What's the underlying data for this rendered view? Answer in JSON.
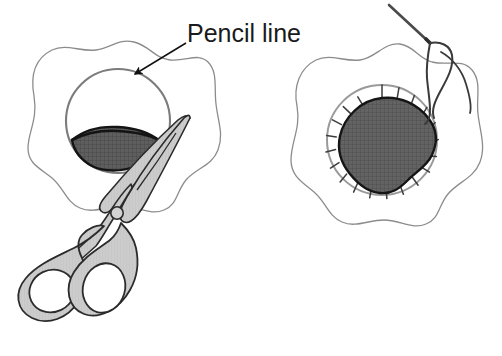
{
  "figure": {
    "background_color": "#ffffff"
  },
  "annotations": {
    "pencil_line_label": "Pencil line"
  },
  "panels": [
    {
      "id": "left-panel",
      "name": "cutting-step",
      "elements": [
        "fabric-outline",
        "pencil-circle",
        "cut-slit",
        "scissors",
        "pencil-line-callout"
      ]
    },
    {
      "id": "right-panel",
      "name": "stitching-step",
      "elements": [
        "fabric-outline",
        "pencil-circle",
        "notch-marks",
        "patch",
        "needle",
        "thread"
      ]
    }
  ],
  "colors": {
    "outline": "#6e6e6e",
    "ink": "#1a1a1a",
    "pencil_circle": "#7a7a7a",
    "scissors_fill": "#c9c9c9",
    "scissors_stroke": "#2b2b2b",
    "patch_fill": "#636363",
    "patch_stroke": "#1a1a1a",
    "notch_stroke": "#3d3d3d",
    "needle": "#4a4a4a",
    "thread": "#3a3a3a",
    "slit_fill": "#5e5e5e",
    "paper": "#ffffff"
  },
  "counts": {
    "notch_marks": 20
  }
}
